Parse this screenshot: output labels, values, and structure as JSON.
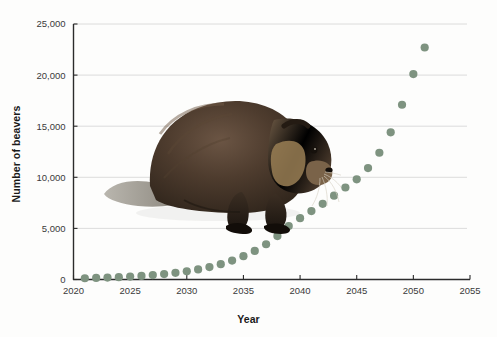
{
  "chart_data": {
    "type": "scatter",
    "title": "",
    "xlabel": "Year",
    "ylabel": "Number of beavers",
    "xlim": [
      2020,
      2055
    ],
    "ylim": [
      0,
      25000
    ],
    "grid": true,
    "legend": null,
    "point_color": "#7e9380",
    "xticks": [
      "2020",
      "2025",
      "2030",
      "2035",
      "2040",
      "2045",
      "2050",
      "2055"
    ],
    "xtick_values": [
      2020,
      2025,
      2030,
      2035,
      2040,
      2045,
      2050,
      2055
    ],
    "yticks": [
      "0",
      "5,000",
      "10,000",
      "15,000",
      "20,000",
      "25,000"
    ],
    "ytick_values": [
      0,
      5000,
      10000,
      15000,
      20000,
      25000
    ],
    "x": [
      2021,
      2022,
      2023,
      2024,
      2025,
      2026,
      2027,
      2028,
      2029,
      2030,
      2031,
      2032,
      2033,
      2034,
      2035,
      2036,
      2037,
      2038,
      2039,
      2040,
      2041,
      2042,
      2043,
      2044,
      2045,
      2046,
      2047,
      2048,
      2049,
      2050,
      2051
    ],
    "values": [
      120,
      150,
      190,
      240,
      300,
      370,
      460,
      570,
      700,
      870,
      1080,
      1330,
      1650,
      2040,
      2520,
      3110,
      3840,
      4620,
      5200,
      5700,
      6300,
      7000,
      7800,
      9200,
      11700,
      14500,
      18000,
      22700,
      300,
      340,
      390
    ],
    "annotations": [
      {
        "type": "image",
        "name": "beaver-photo",
        "description": "photograph of a beaver"
      }
    ]
  },
  "series_points": [
    {
      "year": 2021,
      "beavers": 120
    },
    {
      "year": 2022,
      "beavers": 150
    },
    {
      "year": 2023,
      "beavers": 185
    },
    {
      "year": 2024,
      "beavers": 230
    },
    {
      "year": 2025,
      "beavers": 285
    },
    {
      "year": 2026,
      "beavers": 350
    },
    {
      "year": 2027,
      "beavers": 430
    },
    {
      "year": 2028,
      "beavers": 530
    },
    {
      "year": 2029,
      "beavers": 650
    },
    {
      "year": 2030,
      "beavers": 800
    },
    {
      "year": 2031,
      "beavers": 990
    },
    {
      "year": 2032,
      "beavers": 1220
    },
    {
      "year": 2033,
      "beavers": 1500
    },
    {
      "year": 2034,
      "beavers": 1850
    },
    {
      "year": 2035,
      "beavers": 2280
    },
    {
      "year": 2036,
      "beavers": 2800
    },
    {
      "year": 2037,
      "beavers": 3450
    },
    {
      "year": 2038,
      "beavers": 4250
    },
    {
      "year": 2039,
      "beavers": 5230
    },
    {
      "year": 2040,
      "beavers": 6000
    },
    {
      "year": 2041,
      "beavers": 6700
    },
    {
      "year": 2042,
      "beavers": 7400
    },
    {
      "year": 2043,
      "beavers": 8200
    },
    {
      "year": 2044,
      "beavers": 9000
    },
    {
      "year": 2045,
      "beavers": 9800
    },
    {
      "year": 2046,
      "beavers": 10900
    },
    {
      "year": 2047,
      "beavers": 12400
    },
    {
      "year": 2048,
      "beavers": 14400
    },
    {
      "year": 2049,
      "beavers": 17100
    },
    {
      "year": 2050,
      "beavers": 20100
    },
    {
      "year": 2051,
      "beavers": 22700
    }
  ]
}
